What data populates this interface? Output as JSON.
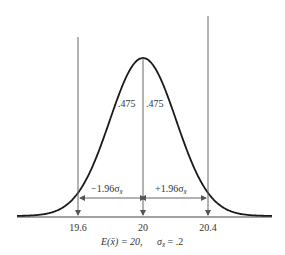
{
  "figure": {
    "curve_type": "normal",
    "mean": 20,
    "sigma_xbar": 0.2,
    "z": 1.96,
    "colors": {
      "curve": "#1a1a1a",
      "lines": "#555555",
      "text": "#333333",
      "background": "#ffffff"
    }
  },
  "labels": {
    "left_area": ".475",
    "right_area": ".475",
    "left_interval": "−1.96σ",
    "left_interval_sub": "x̄",
    "right_interval": "+1.96σ",
    "right_interval_sub": "x̄",
    "tick_left": "19.6",
    "tick_center": "20",
    "tick_right": "20.4",
    "caption_mean": "E(x̄) = 20,",
    "caption_sigma": "σ",
    "caption_sigma_sub": "x̄",
    "caption_sigma_value": " = .2"
  }
}
